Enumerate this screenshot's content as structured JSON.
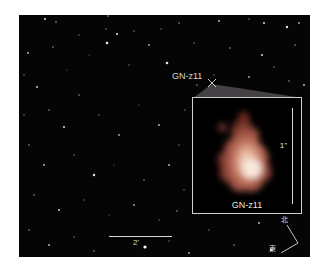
{
  "image": {
    "description": "Deep field astronomical image with zoom-in inset of galaxy GN-z11",
    "background_color": "#050505"
  },
  "target": {
    "label": "GN-z11",
    "marker": "x-marker"
  },
  "inset": {
    "label": "GN-z11",
    "scale_label": "1\"",
    "border_color": "#cfcfcf",
    "galaxy_core_color": "#f3ddd0",
    "galaxy_outer_color": "#9a4a3a"
  },
  "scalebar": {
    "label": "2'"
  },
  "compass": {
    "north": "北",
    "east": "東"
  }
}
